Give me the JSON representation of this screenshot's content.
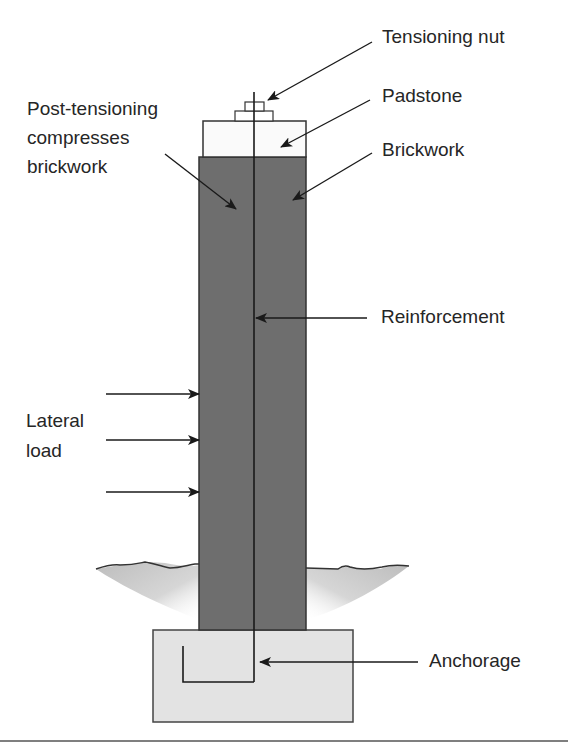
{
  "figure": {
    "type": "post-tensioned brick column cross-section",
    "labels": {
      "tensioning_nut": "Tensioning nut",
      "padstone": "Padstone",
      "brickwork": "Brickwork",
      "post_tensioning": [
        "Post-tensioning",
        "compresses",
        "brickwork"
      ],
      "reinforcement": "Reinforcement",
      "lateral_load": [
        "Lateral",
        "load"
      ],
      "anchorage": "Anchorage"
    },
    "colors": {
      "brickwork": "#6e6e6e",
      "padstone": "#fafafa",
      "footing": "#e3e3e3",
      "ground": "#c4c4c4",
      "line": "#222222"
    }
  }
}
